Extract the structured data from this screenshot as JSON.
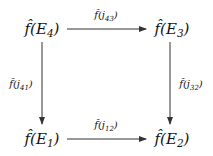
{
  "diagram": {
    "type": "commutative-square",
    "nodes": [
      {
        "id": "E4",
        "base": "f̂(E",
        "sub": "4",
        "close": ")"
      },
      {
        "id": "E3",
        "base": "f̂(E",
        "sub": "3",
        "close": ")"
      },
      {
        "id": "E1",
        "base": "f̂(E",
        "sub": "1",
        "close": ")"
      },
      {
        "id": "E2",
        "base": "f̂(E",
        "sub": "2",
        "close": ")"
      }
    ],
    "edges": [
      {
        "from": "E4",
        "to": "E3",
        "base": "f̂(j",
        "sub": "43",
        "close": ")"
      },
      {
        "from": "E4",
        "to": "E1",
        "base": "f̂(j",
        "sub": "41",
        "close": ")"
      },
      {
        "from": "E3",
        "to": "E2",
        "base": "f̂(j",
        "sub": "32",
        "close": ")"
      },
      {
        "from": "E1",
        "to": "E2",
        "base": "f̂(j",
        "sub": "12",
        "close": ")"
      }
    ],
    "stroke_color": "#333333"
  }
}
